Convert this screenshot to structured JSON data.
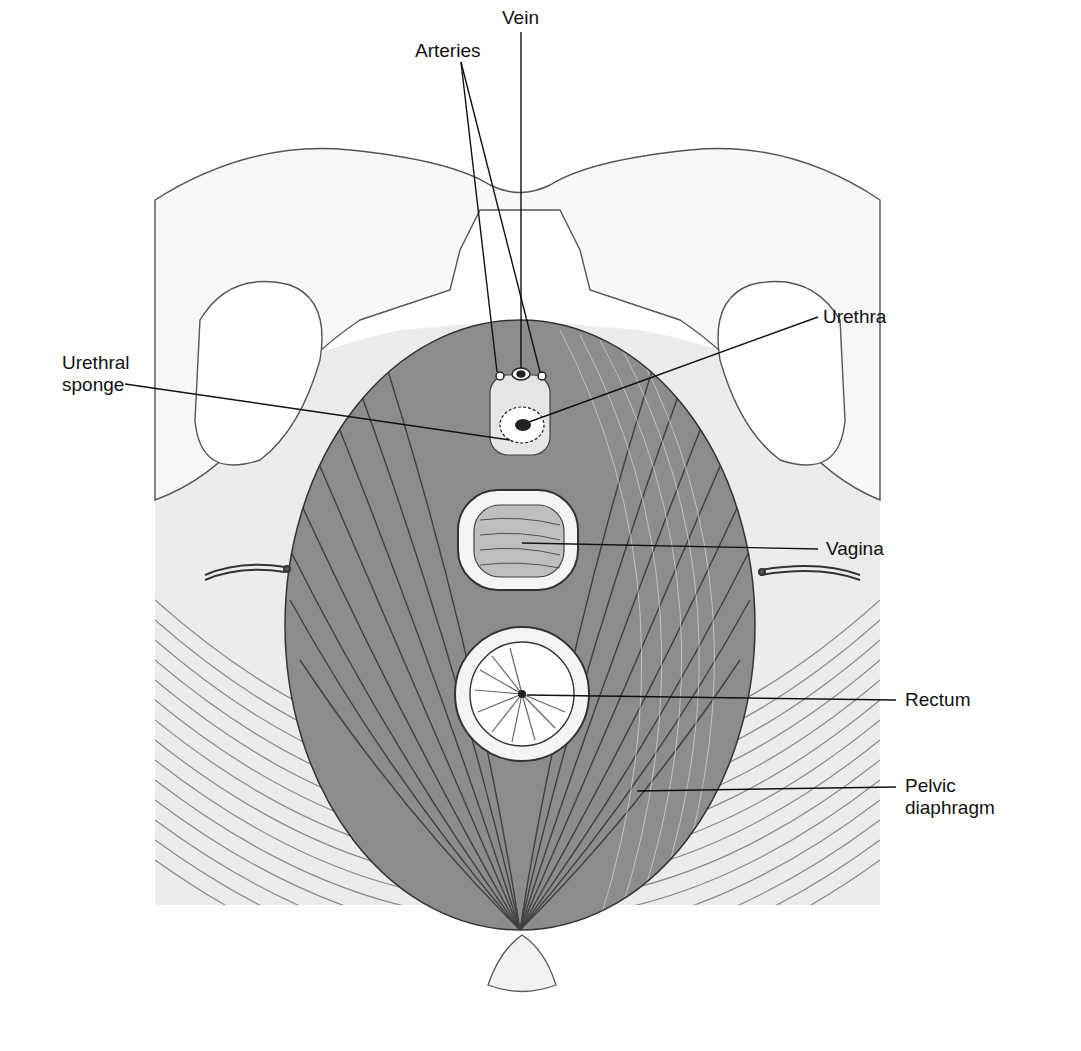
{
  "figure": {
    "colors": {
      "ink": "#1a1a1a",
      "background": "#ffffff",
      "bone": "#f4f4f4",
      "muscle_dark": "#3a3a3a",
      "muscle_light": "#9a9a9a"
    }
  },
  "labels": {
    "vein": "Vein",
    "arteries": "Arteries",
    "urethra": "Urethra",
    "urethral_sponge_line1": "Urethral",
    "urethral_sponge_line2": "sponge",
    "vagina": "Vagina",
    "rectum": "Rectum",
    "pelvic_diaphragm_line1": "Pelvic",
    "pelvic_diaphragm_line2": "diaphragm"
  }
}
